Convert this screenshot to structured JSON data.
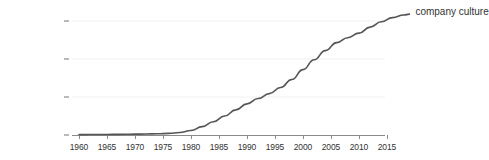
{
  "chart_data": {
    "type": "line",
    "title": "",
    "xlabel": "",
    "ylabel": "",
    "xlim": [
      1960,
      2019
    ],
    "ylim": [
      0.0,
      1.7e-05
    ],
    "grid": true,
    "legend_position": "line-end-right",
    "y_tick_labels": [
      "0.0000000%",
      "0.0000050%",
      "0.0000100%",
      "0.0000150%"
    ],
    "y_tick_values": [
      0.0,
      5e-06,
      1e-05,
      1.5e-05
    ],
    "x_tick_labels": [
      "1960",
      "1965",
      "1970",
      "1975",
      "1980",
      "1985",
      "1990",
      "1995",
      "2000",
      "2005",
      "2010",
      "2015"
    ],
    "x_tick_values": [
      1960,
      1965,
      1970,
      1975,
      1980,
      1985,
      1990,
      1995,
      2000,
      2005,
      2010,
      2015
    ],
    "line_color": "#555555",
    "grid_color": "#f2f2f2",
    "axis_color": "#8a8a8a",
    "series": [
      {
        "name": "company culture",
        "x": [
          1960,
          1962,
          1964,
          1966,
          1968,
          1970,
          1972,
          1974,
          1976,
          1978,
          1980,
          1982,
          1984,
          1986,
          1988,
          1990,
          1992,
          1994,
          1996,
          1998,
          2000,
          2002,
          2004,
          2006,
          2008,
          2010,
          2012,
          2014,
          2016,
          2018,
          2019
        ],
        "values": [
          5e-08,
          6e-08,
          7e-08,
          8e-08,
          9e-08,
          1.1e-07,
          1.3e-07,
          1.6e-07,
          2.1e-07,
          3.2e-07,
          6e-07,
          1.1e-06,
          1.75e-06,
          2.5e-06,
          3.3e-06,
          4.1e-06,
          4.8e-06,
          5.45e-06,
          6.25e-06,
          7.3e-06,
          8.6e-06,
          9.9e-06,
          1.11e-05,
          1.215e-05,
          1.28e-05,
          1.34e-05,
          1.42e-05,
          1.49e-05,
          1.545e-05,
          1.578e-05,
          1.59e-05
        ]
      }
    ]
  },
  "legend": {
    "series_label": "company culture"
  }
}
